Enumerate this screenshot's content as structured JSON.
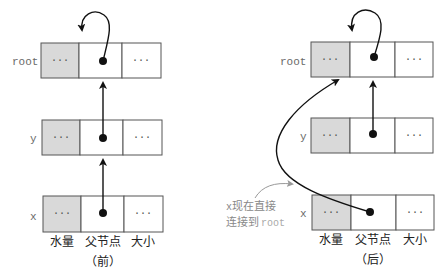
{
  "colors": {
    "shaded_cell": "#d9d9d9",
    "border": "#555555",
    "arrow": "#111111",
    "label_gray": "#6a6a6a",
    "annotation_gray": "#888888"
  },
  "column_labels": [
    "水量",
    "父节点",
    "大小"
  ],
  "cell_placeholder": "···",
  "before": {
    "caption": "（前）",
    "nodes": [
      {
        "label": "root",
        "parent_points_to": "self"
      },
      {
        "label": "y",
        "parent_points_to": "root"
      },
      {
        "label": "x",
        "parent_points_to": "y"
      }
    ]
  },
  "after": {
    "caption": "（后）",
    "nodes": [
      {
        "label": "root",
        "parent_points_to": "self"
      },
      {
        "label": "y",
        "parent_points_to": "root"
      },
      {
        "label": "x",
        "parent_points_to": "root"
      }
    ],
    "annotation_line1_prefix": "x",
    "annotation_line1_text": "现在直接",
    "annotation_line2_text": "连接到",
    "annotation_line2_suffix": "root"
  }
}
